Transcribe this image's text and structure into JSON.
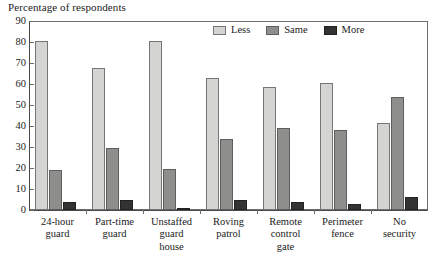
{
  "chart_data": {
    "type": "bar",
    "title": "Percentage of respondents",
    "xlabel": "",
    "ylabel": "",
    "ylim": [
      0,
      90
    ],
    "yticks": [
      0,
      10,
      20,
      30,
      40,
      50,
      60,
      70,
      80,
      90
    ],
    "ytick_labels": [
      "0",
      "10",
      "20",
      "30",
      "40",
      "50",
      "60",
      "70",
      "80",
      "90"
    ],
    "grid": false,
    "legend_position": "top-center",
    "categories": [
      "24-hour guard",
      "Part-time guard",
      "Unstaffed guard house",
      "Roving patrol",
      "Remote control gate",
      "Perimeter fence",
      "No security"
    ],
    "category_lines": [
      [
        "24-hour",
        "guard"
      ],
      [
        "Part-time",
        "guard"
      ],
      [
        "Unstaffed",
        "guard",
        "house"
      ],
      [
        "Roving",
        "patrol"
      ],
      [
        "Remote",
        "control",
        "gate"
      ],
      [
        "Perimeter",
        "fence"
      ],
      [
        "No",
        "security"
      ]
    ],
    "series": [
      {
        "name": "Less",
        "color": "#d4d4d2",
        "values": [
          80.5,
          67.5,
          80.5,
          63,
          58.5,
          60.5,
          41.5
        ]
      },
      {
        "name": "Same",
        "color": "#8e8e8c",
        "values": [
          19,
          29.5,
          19.5,
          34,
          39,
          38,
          54
        ]
      },
      {
        "name": "More",
        "color": "#333333",
        "values": [
          4,
          5,
          1,
          5,
          4,
          3,
          6
        ]
      }
    ]
  },
  "legend": {
    "items": [
      {
        "label": "Less",
        "series": "less"
      },
      {
        "label": "Same",
        "series": "same"
      },
      {
        "label": "More",
        "series": "more"
      }
    ]
  },
  "axis": {
    "frame_color": "#6d6d6d"
  }
}
